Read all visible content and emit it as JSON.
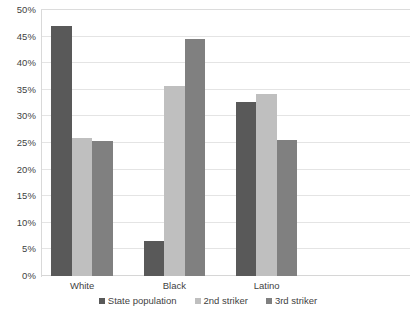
{
  "chart_data": {
    "type": "bar",
    "title": "",
    "xlabel": "",
    "ylabel": "",
    "ylim": [
      0,
      50
    ],
    "ytick_step": 5,
    "ytick_labels": [
      "0%",
      "5%",
      "10%",
      "15%",
      "20%",
      "25%",
      "30%",
      "35%",
      "40%",
      "45%",
      "50%"
    ],
    "grid": true,
    "legend_position": "bottom",
    "categories": [
      "White",
      "Black",
      "Latino"
    ],
    "series": [
      {
        "name": "State population",
        "color": "#595959",
        "values": [
          47.0,
          6.5,
          32.7
        ]
      },
      {
        "name": "2nd striker",
        "color": "#bfbfbf",
        "values": [
          26.0,
          35.8,
          34.2
        ]
      },
      {
        "name": "3rd striker",
        "color": "#808080",
        "values": [
          25.3,
          44.6,
          25.6
        ]
      }
    ],
    "units": "percent",
    "empty_trailing_slot": true
  },
  "legend": {
    "items": [
      {
        "label": "State population"
      },
      {
        "label": "2nd striker"
      },
      {
        "label": "3rd striker"
      }
    ]
  },
  "caption": {
    "clipped_text": ""
  }
}
